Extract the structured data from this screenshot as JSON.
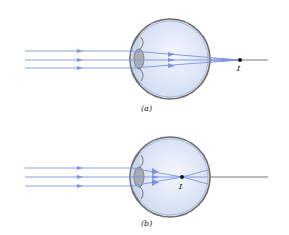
{
  "figure": {
    "panels": [
      {
        "id": "a",
        "caption": "(a)",
        "image_label": "I",
        "description": "Parallel rays focus behind the retina"
      },
      {
        "id": "b",
        "caption": "(b)",
        "image_label": "I",
        "description": "Parallel rays focus in front of the retina"
      }
    ],
    "colors": {
      "ray": "#7b93e0",
      "eyeball_fill": "#dde6f6",
      "eyeball_outline": "#6a6a6a",
      "lens_fill": "#a9adb5",
      "axis_line": "#444444",
      "focus_point": "#111111"
    }
  }
}
